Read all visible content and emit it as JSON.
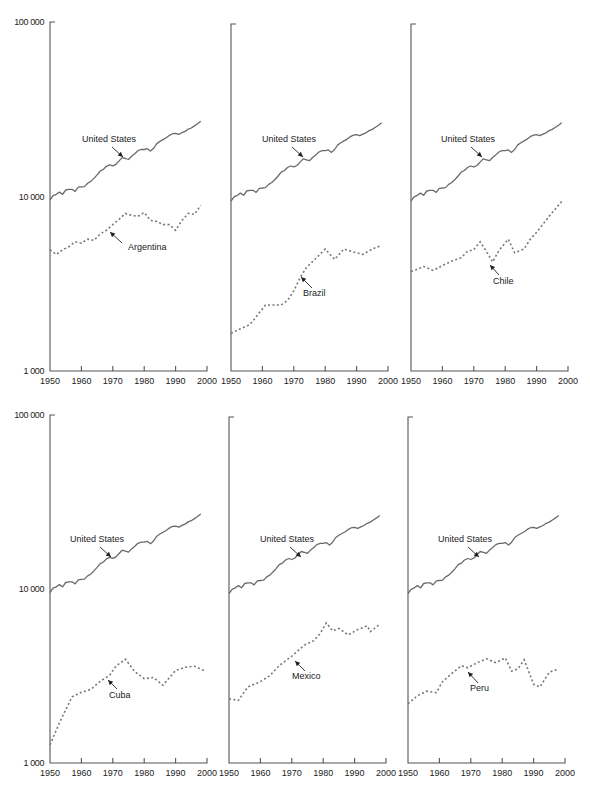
{
  "chart_data": [
    {
      "type": "line",
      "panel": "top-left",
      "title": "",
      "xlabel": "",
      "ylabel": "",
      "yscale": "log",
      "ylim": [
        1000,
        100000
      ],
      "xlim": [
        1950,
        2000
      ],
      "yticks": [
        "1 000",
        "10 000",
        "100 000"
      ],
      "xticks": [
        "1950",
        "1960",
        "1970",
        "1980",
        "1990",
        "2000"
      ],
      "series": [
        {
          "name": "United States",
          "style": "solid",
          "ref": "us"
        },
        {
          "name": "Argentina",
          "style": "dotted",
          "x": [
            1950,
            1952,
            1954,
            1956,
            1958,
            1960,
            1962,
            1964,
            1966,
            1968,
            1970,
            1972,
            1974,
            1976,
            1978,
            1980,
            1982,
            1984,
            1986,
            1988,
            1990,
            1992,
            1994,
            1996,
            1998
          ],
          "values": [
            4950,
            4650,
            4950,
            5150,
            5500,
            5400,
            5700,
            5600,
            6100,
            6400,
            6900,
            7400,
            8000,
            7800,
            7700,
            8100,
            7300,
            7200,
            6900,
            6900,
            6400,
            7300,
            8000,
            7900,
            8900
          ]
        }
      ],
      "annotations": [
        {
          "text": "United States"
        },
        {
          "text": "Argentina"
        }
      ]
    },
    {
      "type": "line",
      "panel": "top-middle",
      "yscale": "log",
      "ylim": [
        1000,
        100000
      ],
      "xlim": [
        1950,
        2000
      ],
      "xticks": [
        "1950",
        "1960",
        "1970",
        "1980",
        "1990",
        "2000"
      ],
      "series": [
        {
          "name": "United States",
          "style": "solid",
          "ref": "us"
        },
        {
          "name": "Brazil",
          "style": "dotted",
          "x": [
            1950,
            1953,
            1956,
            1958,
            1961,
            1964,
            1966,
            1968,
            1970,
            1972,
            1974,
            1977,
            1980,
            1983,
            1986,
            1989,
            1992,
            1995,
            1998
          ],
          "values": [
            1650,
            1750,
            1850,
            2050,
            2400,
            2400,
            2400,
            2550,
            2900,
            3450,
            3950,
            4450,
            5050,
            4400,
            5050,
            4850,
            4700,
            5050,
            5300
          ]
        }
      ],
      "annotations": [
        {
          "text": "United States"
        },
        {
          "text": "Brazil"
        }
      ]
    },
    {
      "type": "line",
      "panel": "top-right",
      "yscale": "log",
      "ylim": [
        1000,
        100000
      ],
      "xlim": [
        1950,
        2000
      ],
      "xticks": [
        "1950",
        "1960",
        "1970",
        "1980",
        "1990",
        "2000"
      ],
      "series": [
        {
          "name": "United States",
          "style": "solid",
          "ref": "us"
        },
        {
          "name": "Chile",
          "style": "dotted",
          "x": [
            1950,
            1952,
            1954,
            1957,
            1960,
            1963,
            1966,
            1968,
            1970,
            1972,
            1974,
            1976,
            1978,
            1981,
            1983,
            1986,
            1988,
            1990,
            1992,
            1994,
            1996,
            1998
          ],
          "values": [
            3750,
            3850,
            4000,
            3800,
            4050,
            4300,
            4500,
            4900,
            5000,
            5550,
            4900,
            4250,
            4950,
            5750,
            4800,
            5050,
            5750,
            6300,
            7000,
            7800,
            8600,
            9500
          ]
        }
      ],
      "annotations": [
        {
          "text": "United States"
        },
        {
          "text": "Chile"
        }
      ]
    },
    {
      "type": "line",
      "panel": "bottom-left",
      "yscale": "log",
      "ylim": [
        1000,
        100000
      ],
      "xlim": [
        1950,
        2000
      ],
      "yticks": [
        "1 000",
        "10 000",
        "100 000"
      ],
      "xticks": [
        "1950",
        "1960",
        "1970",
        "1980",
        "1990",
        "2000"
      ],
      "series": [
        {
          "name": "United States",
          "style": "solid",
          "ref": "us"
        },
        {
          "name": "Cuba",
          "style": "dotted",
          "x": [
            1950,
            1953,
            1957,
            1960,
            1963,
            1966,
            1969,
            1971,
            1974,
            1977,
            1980,
            1983,
            1986,
            1990,
            1993,
            1996,
            1999
          ],
          "values": [
            1270,
            1700,
            2400,
            2550,
            2650,
            2950,
            3200,
            3600,
            3950,
            3350,
            3050,
            3100,
            2800,
            3400,
            3550,
            3600,
            3400
          ]
        }
      ],
      "annotations": [
        {
          "text": "United States"
        },
        {
          "text": "Cuba"
        }
      ]
    },
    {
      "type": "line",
      "panel": "bottom-middle",
      "yscale": "log",
      "ylim": [
        1000,
        100000
      ],
      "xlim": [
        1950,
        2000
      ],
      "xticks": [
        "1950",
        "1960",
        "1970",
        "1980",
        "1990",
        "2000"
      ],
      "series": [
        {
          "name": "United States",
          "style": "solid",
          "ref": "us"
        },
        {
          "name": "Mexico",
          "style": "dotted",
          "x": [
            1950,
            1953,
            1956,
            1960,
            1963,
            1966,
            1970,
            1974,
            1977,
            1979,
            1981,
            1983,
            1985,
            1988,
            1991,
            1994,
            1995,
            1998
          ],
          "values": [
            2350,
            2300,
            2750,
            2950,
            3200,
            3650,
            4150,
            4800,
            5100,
            5600,
            6450,
            5800,
            6000,
            5500,
            5900,
            6200,
            5750,
            6350
          ]
        }
      ],
      "annotations": [
        {
          "text": "United States"
        },
        {
          "text": "Mexico"
        }
      ]
    },
    {
      "type": "line",
      "panel": "bottom-right",
      "yscale": "log",
      "ylim": [
        1000,
        100000
      ],
      "xlim": [
        1950,
        2000
      ],
      "xticks": [
        "1950",
        "1960",
        "1970",
        "1980",
        "1990",
        "2000"
      ],
      "series": [
        {
          "name": "United States",
          "style": "solid",
          "ref": "us"
        },
        {
          "name": "Peru",
          "style": "dotted",
          "x": [
            1950,
            1953,
            1956,
            1959,
            1961,
            1964,
            1967,
            1969,
            1972,
            1975,
            1978,
            1981,
            1983,
            1985,
            1987,
            1990,
            1992,
            1995,
            1998
          ],
          "values": [
            2200,
            2450,
            2600,
            2550,
            2950,
            3300,
            3650,
            3550,
            3800,
            4000,
            3800,
            4050,
            3400,
            3500,
            3950,
            2850,
            2750,
            3350,
            3500
          ]
        }
      ],
      "annotations": [
        {
          "text": "United States"
        },
        {
          "text": "Peru"
        }
      ]
    }
  ],
  "us_series": {
    "name": "United States",
    "x": [
      1950,
      1951,
      1952,
      1953,
      1954,
      1955,
      1956,
      1957,
      1958,
      1959,
      1960,
      1961,
      1962,
      1963,
      1964,
      1965,
      1966,
      1967,
      1968,
      1969,
      1970,
      1971,
      1972,
      1973,
      1974,
      1975,
      1976,
      1977,
      1978,
      1979,
      1980,
      1981,
      1982,
      1983,
      1984,
      1985,
      1986,
      1987,
      1988,
      1989,
      1990,
      1991,
      1992,
      1993,
      1994,
      1995,
      1996,
      1997,
      1998
    ],
    "values": [
      9550,
      10100,
      10300,
      10600,
      10300,
      10900,
      11000,
      11000,
      10700,
      11300,
      11350,
      11400,
      11900,
      12200,
      12700,
      13300,
      14000,
      14300,
      14900,
      15200,
      15000,
      15300,
      16000,
      16700,
      16500,
      16300,
      17000,
      17600,
      18300,
      18600,
      18600,
      18800,
      18200,
      18900,
      20100,
      20700,
      21200,
      21700,
      22400,
      22900,
      23000,
      22700,
      23200,
      23600,
      24300,
      24700,
      25400,
      26100,
      27000
    ]
  },
  "labels": {
    "y_axis": [
      "100 000",
      "10 000",
      "1 000"
    ],
    "x_axis": [
      "1950",
      "1960",
      "1970",
      "1980",
      "1990",
      "2000"
    ],
    "us": "United States",
    "countries": [
      "Argentina",
      "Brazil",
      "Chile",
      "Cuba",
      "Mexico",
      "Peru"
    ]
  }
}
